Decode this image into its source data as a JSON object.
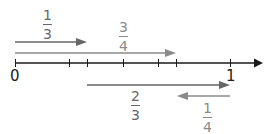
{
  "number_line": {
    "start_label": "0",
    "end_label": "1",
    "axis_color": "#1a1a1a",
    "ticks": [
      "0",
      "1/4",
      "1/3",
      "1/2",
      "2/3",
      "3/4",
      "1"
    ]
  },
  "arrows": [
    {
      "id": "one-third",
      "numerator": "1",
      "denominator": "3",
      "from": 0,
      "to": 0.3333,
      "direction": "right",
      "color": "#666666"
    },
    {
      "id": "three-quarters",
      "numerator": "3",
      "denominator": "4",
      "from": 0,
      "to": 0.75,
      "direction": "right",
      "color": "#8a8a8a"
    },
    {
      "id": "two-thirds",
      "numerator": "2",
      "denominator": "3",
      "from": 0.3333,
      "to": 1,
      "direction": "right",
      "color": "#666666"
    },
    {
      "id": "one-quarter",
      "numerator": "1",
      "denominator": "4",
      "from": 1,
      "to": 0.75,
      "direction": "left",
      "color": "#8a8a8a"
    }
  ]
}
